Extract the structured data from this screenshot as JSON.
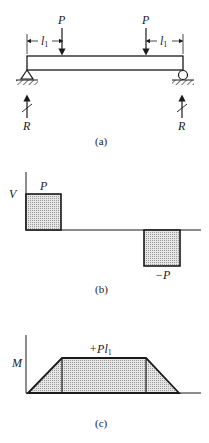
{
  "panels": {
    "a": {
      "caption": "(a)",
      "load_left_label": "P",
      "load_right_label": "P",
      "dim_left_label": "l",
      "dim_left_sub": "1",
      "dim_right_label": "l",
      "dim_right_sub": "1",
      "reaction_left_label": "R",
      "reaction_right_label": "R",
      "support_left": "pin-support",
      "support_right": "roller-support"
    },
    "b": {
      "caption": "(b)",
      "axis_label": "V",
      "positive_label": "P",
      "negative_label": "−P"
    },
    "c": {
      "caption": "(c)",
      "axis_label": "M",
      "peak_label": "+Pl",
      "peak_sub": "1"
    }
  },
  "colors": {
    "ink": "#1a1a1a",
    "fill": "#cfcfcf"
  }
}
